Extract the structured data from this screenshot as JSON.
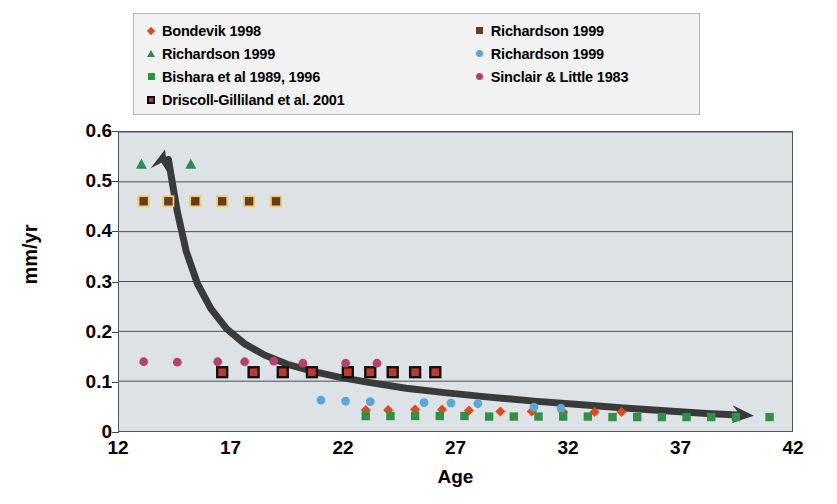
{
  "chart_data": {
    "type": "scatter",
    "title": "",
    "xlabel": "Age",
    "ylabel": "mm/yr",
    "xlim": [
      12,
      42
    ],
    "ylim": [
      0,
      0.6
    ],
    "xticks": [
      12,
      17,
      22,
      27,
      32,
      37,
      42
    ],
    "yticks": [
      "0",
      "0.1",
      "0.2",
      "0.3",
      "0.4",
      "0.5",
      "0.6"
    ],
    "grid": "horizontal",
    "legend_position": "top",
    "annotations": [
      {
        "name": "trend-arrow",
        "description": "Thick dark decay curve with arrowheads at both ends, rising steeply at left (age ~14, 0.56) and flattening to the right (age ~40, 0.028)"
      }
    ],
    "series": [
      {
        "name": "Bondevik 1998",
        "marker": "diamond",
        "color": "#e04a1f",
        "points": [
          {
            "x": 23.0,
            "y": 0.042
          },
          {
            "x": 24.0,
            "y": 0.042
          },
          {
            "x": 25.2,
            "y": 0.043
          },
          {
            "x": 26.4,
            "y": 0.043
          },
          {
            "x": 27.6,
            "y": 0.041
          },
          {
            "x": 29.0,
            "y": 0.039
          },
          {
            "x": 30.4,
            "y": 0.039
          },
          {
            "x": 31.8,
            "y": 0.038
          },
          {
            "x": 33.2,
            "y": 0.038
          },
          {
            "x": 34.4,
            "y": 0.038
          }
        ]
      },
      {
        "name": "Richardson 1999",
        "marker": "triangle",
        "color": "#2a8f4e",
        "points": [
          {
            "x": 13.0,
            "y": 0.535
          },
          {
            "x": 15.2,
            "y": 0.535
          }
        ]
      },
      {
        "name": "Bishara et al 1989, 1996",
        "marker": "square",
        "color": "#2f9141",
        "points": [
          {
            "x": 23.0,
            "y": 0.03
          },
          {
            "x": 24.1,
            "y": 0.03
          },
          {
            "x": 25.2,
            "y": 0.03
          },
          {
            "x": 26.3,
            "y": 0.03
          },
          {
            "x": 27.4,
            "y": 0.03
          },
          {
            "x": 28.5,
            "y": 0.029
          },
          {
            "x": 29.6,
            "y": 0.029
          },
          {
            "x": 30.7,
            "y": 0.029
          },
          {
            "x": 31.8,
            "y": 0.029
          },
          {
            "x": 32.9,
            "y": 0.029
          },
          {
            "x": 34.0,
            "y": 0.028
          },
          {
            "x": 35.1,
            "y": 0.028
          },
          {
            "x": 36.2,
            "y": 0.028
          },
          {
            "x": 37.3,
            "y": 0.028
          },
          {
            "x": 38.4,
            "y": 0.028
          },
          {
            "x": 39.5,
            "y": 0.028
          },
          {
            "x": 41.0,
            "y": 0.028
          }
        ]
      },
      {
        "name": "Driscoll-Gilliland et al. 2001",
        "marker": "square-ring",
        "color": "#c0392b",
        "points": [
          {
            "x": 16.6,
            "y": 0.118
          },
          {
            "x": 18.0,
            "y": 0.118
          },
          {
            "x": 19.3,
            "y": 0.118
          },
          {
            "x": 20.6,
            "y": 0.118
          },
          {
            "x": 22.2,
            "y": 0.118
          },
          {
            "x": 23.2,
            "y": 0.118
          },
          {
            "x": 24.2,
            "y": 0.118
          },
          {
            "x": 25.2,
            "y": 0.118
          },
          {
            "x": 26.1,
            "y": 0.118
          }
        ]
      },
      {
        "name": "Richardson 1999",
        "marker": "square",
        "color": "#6b3a1e",
        "points": [
          {
            "x": 13.1,
            "y": 0.461
          },
          {
            "x": 14.2,
            "y": 0.461
          },
          {
            "x": 15.4,
            "y": 0.461
          },
          {
            "x": 16.6,
            "y": 0.461
          },
          {
            "x": 17.8,
            "y": 0.461
          },
          {
            "x": 19.0,
            "y": 0.461
          }
        ]
      },
      {
        "name": "Richardson 1999",
        "marker": "circle",
        "color": "#5aa7d8",
        "points": [
          {
            "x": 21.0,
            "y": 0.062
          },
          {
            "x": 22.1,
            "y": 0.06
          },
          {
            "x": 23.2,
            "y": 0.059
          },
          {
            "x": 25.6,
            "y": 0.057
          },
          {
            "x": 26.8,
            "y": 0.056
          },
          {
            "x": 28.0,
            "y": 0.055
          },
          {
            "x": 30.5,
            "y": 0.048
          },
          {
            "x": 31.7,
            "y": 0.046
          }
        ]
      },
      {
        "name": "Sinclair & Little 1983",
        "marker": "circle",
        "color": "#b8416b",
        "points": [
          {
            "x": 13.1,
            "y": 0.139
          },
          {
            "x": 14.6,
            "y": 0.138
          },
          {
            "x": 16.4,
            "y": 0.139
          },
          {
            "x": 17.6,
            "y": 0.139
          },
          {
            "x": 18.9,
            "y": 0.14
          },
          {
            "x": 20.2,
            "y": 0.136
          },
          {
            "x": 22.1,
            "y": 0.136
          },
          {
            "x": 23.5,
            "y": 0.136
          }
        ]
      }
    ]
  },
  "legend": {
    "column_left": [
      {
        "label": "Bondevik 1998",
        "marker": "diamond",
        "color": "#e04a1f",
        "name": "legend-bondevik-1998"
      },
      {
        "label": "Richardson 1999",
        "marker": "triangle",
        "color": "#2a8f4e",
        "name": "legend-richardson-1999-triangle"
      },
      {
        "label": "Bishara et al 1989, 1996",
        "marker": "square",
        "color": "#2f9141",
        "name": "legend-bishara"
      },
      {
        "label": "Driscoll-Gilliland et al. 2001",
        "marker": "square-ring",
        "color": "#c0392b",
        "name": "legend-driscoll-gilliland"
      }
    ],
    "column_right": [
      {
        "label": "Richardson 1999",
        "marker": "square",
        "color": "#6b3a1e",
        "name": "legend-richardson-1999-square"
      },
      {
        "label": "Richardson 1999",
        "marker": "circle",
        "color": "#5aa7d8",
        "name": "legend-richardson-1999-circle"
      },
      {
        "label": "Sinclair & Little 1983",
        "marker": "circle",
        "color": "#b8416b",
        "name": "legend-sinclair-little"
      }
    ]
  },
  "style": {
    "plot_background": "#dde2e7",
    "page_background": "#ffffff",
    "gridline_color": "#4a4a4a",
    "axis_color": "#555555",
    "curve_color": "#3a3a3a",
    "legend_background": "#f2f2f2",
    "legend_border": "#b9b9b9"
  }
}
